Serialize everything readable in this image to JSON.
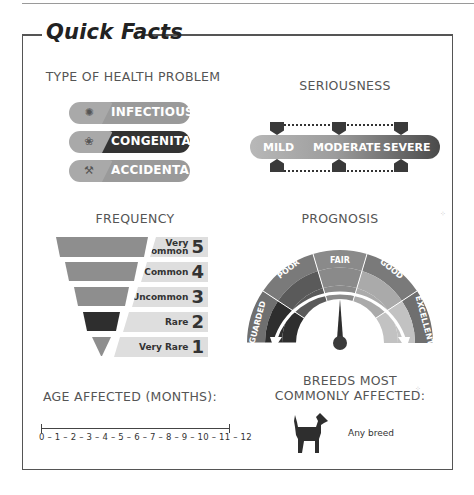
{
  "title": "Quick Facts",
  "type_of_health_problem": {
    "heading": "TYPE OF HEALTH PROBLEM",
    "items": [
      {
        "label": "INFECTIOUS",
        "icon": "germ-icon",
        "color": "#9a9a9a"
      },
      {
        "label": "CONGENITAL",
        "icon": "brain-icon",
        "color": "#333333"
      },
      {
        "label": "ACCIDENTAL",
        "icon": "bone-icon",
        "color": "#9a9a9a"
      }
    ]
  },
  "seriousness": {
    "heading": "SERIOUSNESS",
    "levels": [
      "MILD",
      "MODERATE",
      "SEVERE"
    ]
  },
  "frequency": {
    "heading": "FREQUENCY",
    "levels": [
      {
        "label_line1": "Very",
        "label_line2": "Common",
        "number": "5",
        "color": "#8e8e8e"
      },
      {
        "label_line1": "",
        "label_line2": "Common",
        "number": "4",
        "color": "#8e8e8e"
      },
      {
        "label_line1": "",
        "label_line2": "Uncommon",
        "number": "3",
        "color": "#8e8e8e"
      },
      {
        "label_line1": "",
        "label_line2": "Rare",
        "number": "2",
        "color": "#2e2e2e"
      },
      {
        "label_line1": "",
        "label_line2": "Very Rare",
        "number": "1",
        "color": "#8e8e8e"
      }
    ]
  },
  "prognosis": {
    "heading": "PROGNOSIS",
    "levels": [
      "GUARDED",
      "POOR",
      "FAIR",
      "GOOD",
      "EXCELLENT"
    ]
  },
  "age_affected": {
    "heading": "AGE AFFECTED (MONTHS):",
    "scale": "0 – 1 – 2 – 3 – 4 – 5 – 6 – 7 – 8 – 9 – 10 – 11 – 12"
  },
  "breeds": {
    "heading_line1": "BREEDS MOST",
    "heading_line2": "COMMONLY AFFECTED:",
    "icon": "dog-icon",
    "text": "Any breed"
  }
}
